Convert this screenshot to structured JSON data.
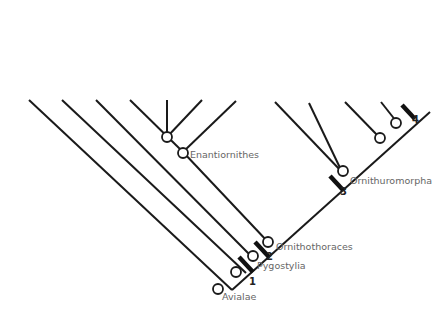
{
  "figure": {
    "type": "cladogram",
    "taxa": [
      {
        "label": "Archaeopteryx",
        "italic": true
      },
      {
        "label": "Rahonavis",
        "italic": true
      },
      {
        "label": "Confuciusornithidae",
        "italic": false
      },
      {
        "label": "Gobypteryx",
        "italic": true
      },
      {
        "label": "Sinornis",
        "italic": true
      },
      {
        "label": "Concornis",
        "italic": true
      },
      {
        "label": "Iberomesornis",
        "italic": true
      },
      {
        "label": "Patagopteryx",
        "italic": true
      },
      {
        "label": "Vorona",
        "italic": true
      },
      {
        "label": "Hesperornis",
        "italic": true
      },
      {
        "label": "Ichthyornis",
        "italic": true
      },
      {
        "label": "Aves",
        "italic": false
      }
    ],
    "clades": [
      {
        "label": "Avialae"
      },
      {
        "label": "Pygostylia"
      },
      {
        "label": "Ornithothoraces"
      },
      {
        "label": "Enantiornithes"
      },
      {
        "label": "Ornithuromorpha"
      }
    ],
    "synapomorphy_markers": [
      "1",
      "2",
      "3",
      "4"
    ],
    "colors": {
      "line": "#1a1a1a",
      "text": "#666666",
      "marker": "#111111"
    }
  }
}
